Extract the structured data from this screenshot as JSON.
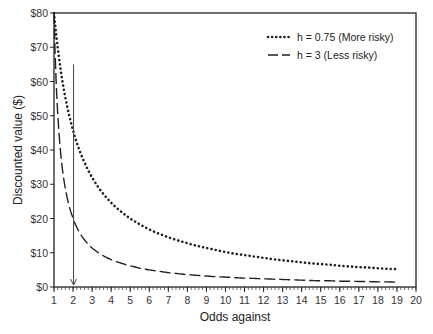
{
  "chart_data": {
    "type": "line",
    "title": "",
    "xlabel": "Odds against",
    "ylabel": "Discounted value ($)",
    "xlim": [
      1,
      20
    ],
    "ylim": [
      0,
      80
    ],
    "x_ticks": [
      1,
      2,
      3,
      4,
      5,
      6,
      7,
      8,
      9,
      10,
      11,
      12,
      13,
      14,
      15,
      16,
      17,
      18,
      19,
      20
    ],
    "y_ticks": [
      0,
      10,
      20,
      30,
      40,
      50,
      60,
      70,
      80
    ],
    "y_tick_labels": [
      "$0",
      "$10",
      "$20",
      "$30",
      "$40",
      "$50",
      "$60",
      "$70",
      "$80"
    ],
    "x_minor_tick_step": 0.2,
    "grid": false,
    "legend_position": "upper right (inside)",
    "x": [
      1,
      1.5,
      2,
      2.5,
      3,
      3.5,
      4,
      4.5,
      5,
      5.5,
      6,
      6.5,
      7,
      7.5,
      8,
      8.5,
      9,
      9.5,
      10,
      10.5,
      11,
      11.5,
      12,
      12.5,
      13,
      13.5,
      14,
      14.5,
      15,
      15.5,
      16,
      16.5,
      17,
      17.5,
      18,
      18.5,
      19
    ],
    "series": [
      {
        "name": "h = 0.75 (More risky)",
        "style": "dotted",
        "values": [
          80.0,
          58.2,
          45.7,
          37.6,
          32.0,
          27.8,
          24.6,
          22.1,
          20.0,
          18.3,
          16.8,
          15.6,
          14.5,
          13.6,
          12.8,
          12.0,
          11.4,
          10.8,
          10.2,
          9.7,
          9.3,
          8.9,
          8.5,
          8.1,
          7.8,
          7.5,
          7.2,
          6.9,
          6.7,
          6.5,
          6.2,
          6.0,
          5.8,
          5.7,
          5.5,
          5.3,
          5.2
        ]
      },
      {
        "name": "h = 3 (Less risky)",
        "style": "dashed",
        "values": [
          80.0,
          32.0,
          20.0,
          14.5,
          11.4,
          9.4,
          8.0,
          7.0,
          6.2,
          5.5,
          5.0,
          4.6,
          4.2,
          3.9,
          3.6,
          3.4,
          3.2,
          3.0,
          2.9,
          2.7,
          2.6,
          2.5,
          2.4,
          2.3,
          2.2,
          2.1,
          2.0,
          1.9,
          1.8,
          1.8,
          1.7,
          1.7,
          1.6,
          1.6,
          1.5,
          1.5,
          1.4
        ]
      }
    ],
    "annotations": [
      {
        "type": "arrow",
        "x": 2,
        "y_from": 65,
        "y_to": 0,
        "direction": "down"
      }
    ]
  },
  "legend": {
    "items": [
      {
        "label": "h = 0.75 (More risky)",
        "style": "dotted"
      },
      {
        "label": "h = 3 (Less risky)",
        "style": "dashed"
      }
    ]
  },
  "axes": {
    "xlabel": "Odds against",
    "ylabel": "Discounted value ($)"
  }
}
